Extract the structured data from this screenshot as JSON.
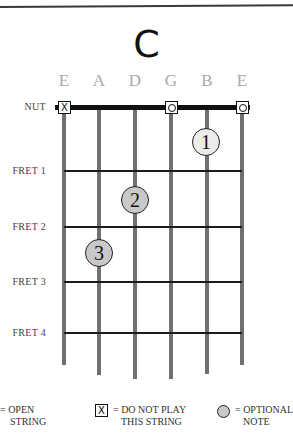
{
  "chord": {
    "name": "C"
  },
  "strings": [
    {
      "label": "E",
      "x": 64,
      "bottom": 365,
      "marker": "x"
    },
    {
      "label": "A",
      "x": 99,
      "bottom": 375,
      "marker": null
    },
    {
      "label": "D",
      "x": 135,
      "bottom": 379,
      "marker": null
    },
    {
      "label": "G",
      "x": 171,
      "bottom": 379,
      "marker": "o"
    },
    {
      "label": "B",
      "x": 207,
      "bottom": 374,
      "marker": null
    },
    {
      "label": "E",
      "x": 242,
      "bottom": 365,
      "marker": "o"
    }
  ],
  "frets": [
    {
      "label": "NUT",
      "y": 107
    },
    {
      "label": "FRET 1",
      "y": 171
    },
    {
      "label": "FRET 2",
      "y": 227
    },
    {
      "label": "FRET 3",
      "y": 282
    },
    {
      "label": "FRET 4",
      "y": 333
    }
  ],
  "markers": {
    "x_glyph": "X",
    "o_glyph": "O"
  },
  "fingers": [
    {
      "number": "1",
      "x": 206,
      "y": 142,
      "fill": "#ececec"
    },
    {
      "number": "2",
      "x": 135,
      "y": 200,
      "fill": "#c9c9c9"
    },
    {
      "number": "3",
      "x": 99,
      "y": 253,
      "fill": "#c9c9c9"
    }
  ],
  "legend": {
    "open_line1": "= OPEN",
    "open_line2": "STRING",
    "mute_glyph": "X",
    "mute_line1": "= DO NOT PLAY",
    "mute_line2": "THIS STRING",
    "optional_line1": "= OPTIONAL",
    "optional_line2": "NOTE"
  },
  "colors": {
    "string": "#707070",
    "fret": "#1a1a1a",
    "label_gray": "#a9a9a9",
    "finger_light": "#ececec",
    "finger_mid": "#c9c9c9"
  }
}
